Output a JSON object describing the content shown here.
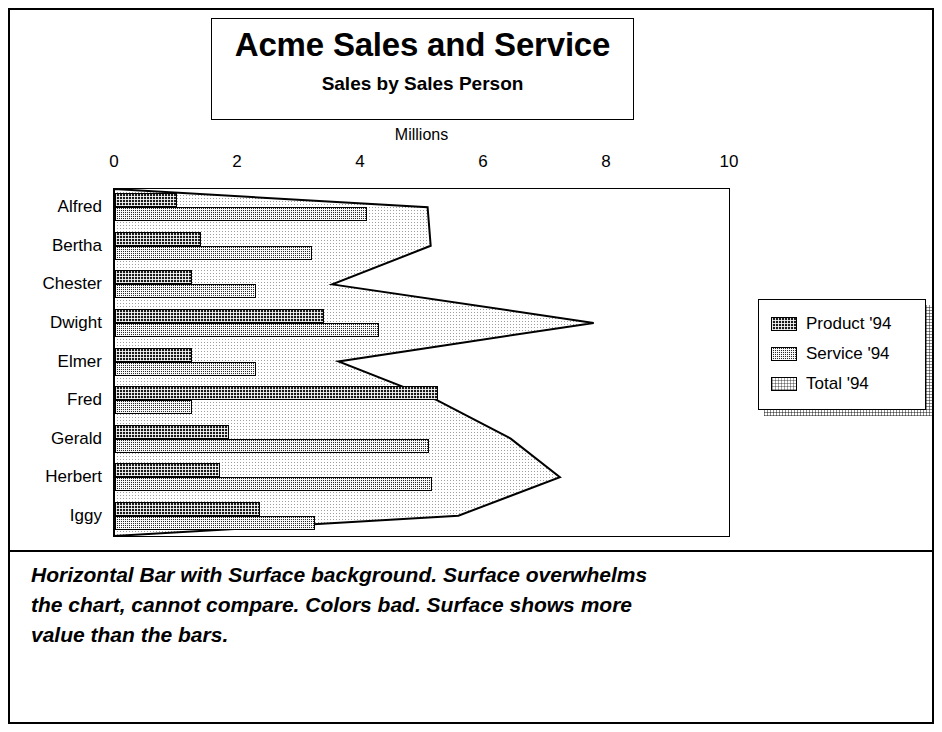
{
  "title_box": {
    "title": "Acme Sales and Service",
    "subtitle": "Sales by Sales Person"
  },
  "caption": "Horizontal Bar with Surface background. Surface overwhelms the chart, cannot compare. Colors bad. Surface shows more value than the bars.",
  "legend": {
    "items": [
      {
        "label": "Product '94",
        "pattern": "dark-dense-checker"
      },
      {
        "label": "Service '94",
        "pattern": "medium-checker"
      },
      {
        "label": "Total '94",
        "pattern": "light-dots"
      }
    ]
  },
  "chart_data": {
    "type": "bar",
    "orientation": "horizontal",
    "title": "Acme Sales and Service",
    "subtitle": "Sales by Sales Person",
    "xlabel": "Millions",
    "ylabel": "",
    "xlim": [
      0,
      10
    ],
    "xticks": [
      0,
      2,
      4,
      6,
      8,
      10
    ],
    "grid": false,
    "legend_position": "right",
    "categories": [
      "Alfred",
      "Bertha",
      "Chester",
      "Dwight",
      "Elmer",
      "Fred",
      "Gerald",
      "Herbert",
      "Iggy"
    ],
    "series": [
      {
        "name": "Product '94",
        "values": [
          1.0,
          1.4,
          1.25,
          3.4,
          1.25,
          5.25,
          1.85,
          1.7,
          2.35
        ]
      },
      {
        "name": "Service '94",
        "values": [
          4.1,
          3.2,
          2.3,
          4.3,
          2.3,
          1.25,
          5.1,
          5.15,
          3.25
        ]
      },
      {
        "name": "Total '94",
        "values": [
          5.1,
          5.15,
          3.55,
          7.8,
          3.65,
          5.25,
          6.45,
          7.25,
          5.6
        ],
        "rendered_as": "surface-area-background"
      }
    ],
    "annotations": [
      "Horizontal Bar with Surface background. Surface overwhelms the chart, cannot compare. Colors bad. Surface shows more value than the bars."
    ]
  }
}
